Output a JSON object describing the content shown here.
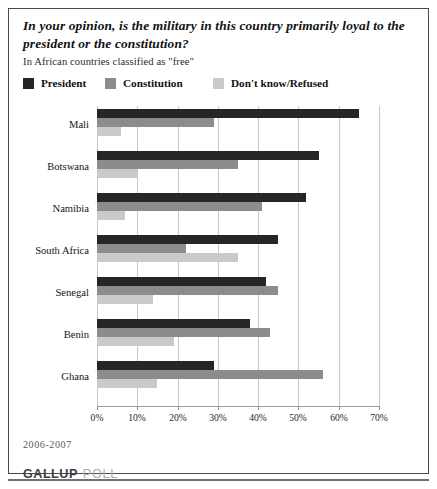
{
  "header": {
    "title": "In your opinion, is the military in this country primarily loyal to the president or the constitution?",
    "subtitle": "In African countries classified as \"free\""
  },
  "footer": {
    "date_range": "2006-2007",
    "brand_primary": "GALLUP",
    "brand_secondary": "POLL"
  },
  "colors": {
    "president": "#262626",
    "constitution": "#8c8c8c",
    "dont_know": "#c9c9c9",
    "gridline": "#c8c8c8",
    "border": "#4a4a4a"
  },
  "chart_data": {
    "type": "bar",
    "orientation": "horizontal",
    "title": "In your opinion, is the military in this country primarily loyal to the president or the constitution?",
    "subtitle": "In African countries classified as \"free\"",
    "xlabel": "",
    "ylabel": "",
    "xlim": [
      0,
      70
    ],
    "grid": true,
    "legend_position": "top-left",
    "tick_labels": [
      "0%",
      "10%",
      "20%",
      "30%",
      "40%",
      "50%",
      "60%",
      "70%"
    ],
    "tick_values": [
      0,
      10,
      20,
      30,
      40,
      50,
      60,
      70
    ],
    "categories": [
      "Mali",
      "Botswana",
      "Namibia",
      "South Africa",
      "Senegal",
      "Benin",
      "Ghana"
    ],
    "series": [
      {
        "name": "President",
        "color": "#262626",
        "values": [
          65,
          55,
          52,
          45,
          42,
          38,
          29
        ]
      },
      {
        "name": "Constitution",
        "color": "#8c8c8c",
        "values": [
          29,
          35,
          41,
          22,
          45,
          43,
          56
        ]
      },
      {
        "name": "Don't know/Refused",
        "color": "#c9c9c9",
        "values": [
          6,
          10,
          7,
          35,
          14,
          19,
          15
        ]
      }
    ]
  }
}
